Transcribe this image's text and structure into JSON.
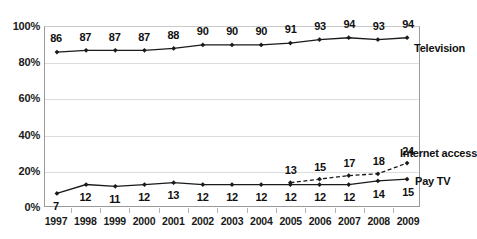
{
  "chart_data": {
    "type": "line",
    "title": "",
    "subtitle": "",
    "xlabel": "",
    "ylabel": "",
    "categories": [
      "1997",
      "1998",
      "1999",
      "2000",
      "2001",
      "2002",
      "2003",
      "2004",
      "2005",
      "2006",
      "2007",
      "2008",
      "2009"
    ],
    "ylim": [
      0,
      100
    ],
    "yticks": [
      0,
      20,
      40,
      60,
      80,
      100
    ],
    "ytick_labels": [
      "0%",
      "20%",
      "40%",
      "60%",
      "80%",
      "100%"
    ],
    "grid": "horizontal",
    "legend_position": "right-inline-labels",
    "data_labels": true,
    "series": [
      {
        "name": "Television",
        "line_style": "solid",
        "color": "#1a1a1a",
        "marker": "diamond",
        "label_position": "above",
        "values": [
          86,
          87,
          87,
          87,
          88,
          90,
          90,
          90,
          91,
          93,
          94,
          93,
          94
        ]
      },
      {
        "name": "Pay TV",
        "line_style": "solid",
        "color": "#1a1a1a",
        "marker": "diamond",
        "label_position": "below",
        "values": [
          7,
          12,
          11,
          12,
          13,
          12,
          12,
          12,
          12,
          12,
          12,
          14,
          15
        ]
      },
      {
        "name": "Internet access",
        "line_style": "dashed",
        "color": "#1a1a1a",
        "marker": "diamond",
        "label_position": "above",
        "values": [
          null,
          null,
          null,
          null,
          null,
          null,
          null,
          null,
          13,
          15,
          17,
          18,
          24
        ]
      }
    ]
  }
}
